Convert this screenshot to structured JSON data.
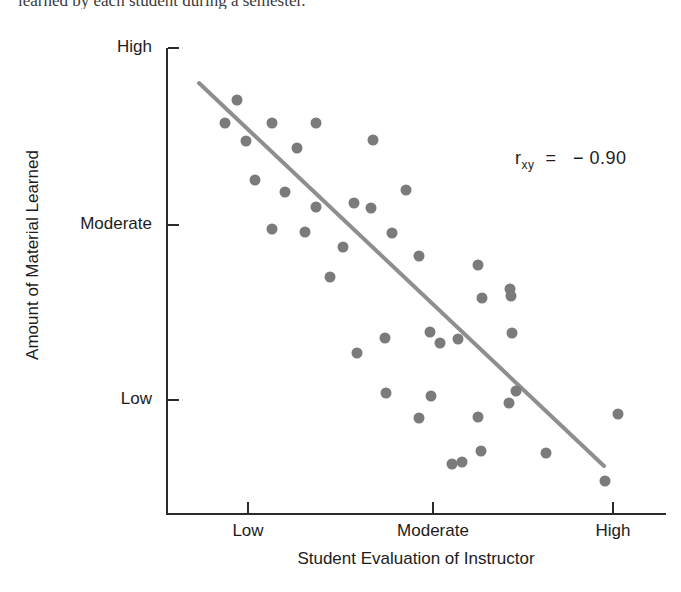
{
  "caption_fragment": "learned by each student during a semester.",
  "chart_data": {
    "type": "scatter",
    "title": "",
    "xlabel": "Student Evaluation of Instructor",
    "ylabel": "Amount of Material Learned",
    "x_tick_labels": [
      "Low",
      "Moderate",
      "High"
    ],
    "y_tick_labels": [
      "High",
      "Moderate",
      "Low"
    ],
    "x_tick_positions_px": [
      248,
      433,
      613
    ],
    "y_tick_positions_px": [
      48,
      225,
      400
    ],
    "xlim_px": [
      166,
      666
    ],
    "ylim_px": [
      48,
      513
    ],
    "grid": false,
    "legend": "none",
    "annotation": "r_xy = − 0.90",
    "correlation": -0.9,
    "point_color": "#7b7b7b",
    "axis_color": "#2b2b2b",
    "trend_line_color": "#8e8e8e",
    "point_radius_px": 5.5,
    "n_points": 39,
    "trend_line": {
      "x1": 199,
      "y1": 83,
      "x2": 604,
      "y2": 466
    },
    "points": [
      [
        237,
        100
      ],
      [
        225,
        123
      ],
      [
        272,
        123
      ],
      [
        316,
        123
      ],
      [
        246,
        148
      ],
      [
        297,
        148
      ],
      [
        375,
        140
      ],
      [
        255,
        181
      ],
      [
        285,
        194
      ],
      [
        317,
        207
      ],
      [
        354,
        203
      ],
      [
        407,
        190
      ],
      [
        371,
        208
      ],
      [
        272,
        229
      ],
      [
        305,
        231
      ],
      [
        343,
        246
      ],
      [
        392,
        233
      ],
      [
        394,
        231
      ],
      [
        394,
        234
      ],
      [
        391,
        233
      ],
      [
        393,
        232
      ],
      [
        393,
        233
      ],
      [
        392,
        232
      ],
      [
        395,
        233
      ],
      [
        389,
        233
      ],
      [
        396,
        231
      ],
      [
        330,
        277
      ],
      [
        419,
        256
      ],
      [
        478,
        265
      ],
      [
        510,
        290
      ],
      [
        386,
        338
      ],
      [
        400,
        337
      ],
      [
        386,
        337
      ],
      [
        357,
        354
      ],
      [
        383,
        356
      ],
      [
        440,
        342
      ],
      [
        482,
        299
      ],
      [
        511,
        297
      ],
      [
        458,
        338
      ],
      [
        509,
        335
      ],
      [
        430,
        331
      ],
      [
        386,
        393
      ],
      [
        430,
        395
      ],
      [
        516,
        392
      ],
      [
        418,
        418
      ],
      [
        477,
        418
      ],
      [
        509,
        402
      ],
      [
        481,
        452
      ],
      [
        452,
        463
      ],
      [
        545,
        452
      ],
      [
        460,
        462
      ],
      [
        618,
        453
      ],
      [
        605,
        480
      ],
      [
        604,
        482
      ]
    ],
    "points_precise": [
      [
        237,
        100
      ],
      [
        225,
        123
      ],
      [
        272,
        123
      ],
      [
        316,
        123
      ],
      [
        246,
        141
      ],
      [
        297,
        148
      ],
      [
        373,
        140
      ],
      [
        255,
        180
      ],
      [
        285,
        192
      ],
      [
        316,
        207
      ],
      [
        354,
        203
      ],
      [
        371,
        208
      ],
      [
        406,
        190
      ],
      [
        272,
        229
      ],
      [
        305,
        232
      ],
      [
        343,
        247
      ],
      [
        392,
        233
      ],
      [
        330,
        277
      ],
      [
        419,
        256
      ],
      [
        478,
        265
      ],
      [
        510,
        289
      ],
      [
        357,
        353
      ],
      [
        385,
        338
      ],
      [
        440,
        343
      ],
      [
        482,
        298
      ],
      [
        511,
        296
      ],
      [
        458,
        339
      ],
      [
        512,
        333
      ],
      [
        430,
        332
      ],
      [
        386,
        393
      ],
      [
        431,
        396
      ],
      [
        516,
        391
      ],
      [
        419,
        418
      ],
      [
        478,
        417
      ],
      [
        509,
        403
      ],
      [
        481,
        451
      ],
      [
        452,
        464
      ],
      [
        546,
        453
      ],
      [
        462,
        462
      ],
      [
        618,
        414
      ],
      [
        605,
        481
      ]
    ]
  }
}
